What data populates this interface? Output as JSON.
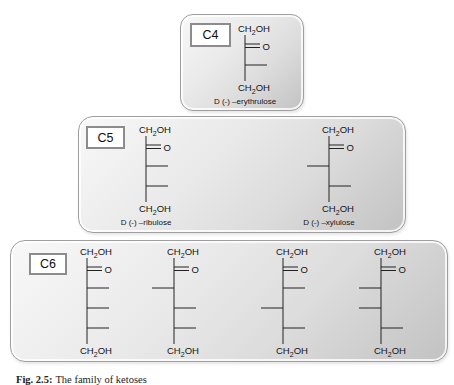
{
  "caption": {
    "label": "Fig. 2.5:",
    "text": "The family of ketoses"
  },
  "panels": [
    {
      "id": "c4",
      "label": "C4",
      "molecules": [
        {
          "name": "D (-) –erythrulose",
          "top_group": "CH2OH",
          "keto": "O",
          "bottom_group": "CH2OH",
          "centers": [
            "right"
          ]
        }
      ]
    },
    {
      "id": "c5",
      "label": "C5",
      "molecules": [
        {
          "name": "D (-) –ribulose",
          "top_group": "CH2OH",
          "keto": "O",
          "bottom_group": "CH2OH",
          "centers": [
            "right",
            "right"
          ]
        },
        {
          "name": "D (-) –xylulose",
          "top_group": "CH2OH",
          "keto": "O",
          "bottom_group": "CH2OH",
          "centers": [
            "left",
            "right"
          ]
        }
      ]
    },
    {
      "id": "c6",
      "label": "C6",
      "molecules": [
        {
          "name": "",
          "top_group": "CH2OH",
          "keto": "O",
          "bottom_group": "CH2OH",
          "centers": [
            "right",
            "right",
            "right"
          ]
        },
        {
          "name": "",
          "top_group": "CH2OH",
          "keto": "O",
          "bottom_group": "CH2OH",
          "centers": [
            "left",
            "right",
            "right"
          ]
        },
        {
          "name": "",
          "top_group": "CH2OH",
          "keto": "O",
          "bottom_group": "CH2OH",
          "centers": [
            "right",
            "left",
            "right"
          ]
        },
        {
          "name": "",
          "top_group": "CH2OH",
          "keto": "O",
          "bottom_group": "CH2OH",
          "centers": [
            "left",
            "left",
            "right"
          ]
        }
      ]
    }
  ]
}
